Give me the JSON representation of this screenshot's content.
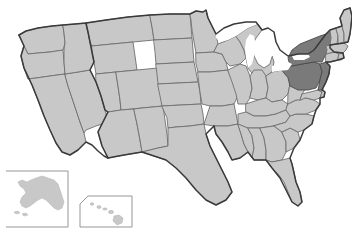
{
  "map": {
    "title": "United States choropleth map",
    "projection": "albers-usa",
    "background_color": "#ffffff",
    "base_state_fill": "#c8c8c8",
    "highlight_fill": "#7a7a7a",
    "border_color": "#6e6e6e",
    "national_outline_color": "#3a3a3a",
    "lake_fill": "#ffffff",
    "inset_box_color": "#8a8a8a",
    "highlighted_region_label": "Mid-Atlantic",
    "highlighted_states": [
      "New York",
      "Pennsylvania",
      "New Jersey"
    ],
    "insets": [
      {
        "name": "Alaska",
        "box_shape": "rectangle"
      },
      {
        "name": "Hawaii",
        "box_shape": "angled-corner"
      }
    ],
    "states": [
      {
        "code": "WA",
        "name": "Washington",
        "highlighted": false
      },
      {
        "code": "OR",
        "name": "Oregon",
        "highlighted": false
      },
      {
        "code": "CA",
        "name": "California",
        "highlighted": false
      },
      {
        "code": "NV",
        "name": "Nevada",
        "highlighted": false
      },
      {
        "code": "ID",
        "name": "Idaho",
        "highlighted": false
      },
      {
        "code": "MT",
        "name": "Montana",
        "highlighted": false
      },
      {
        "code": "WY",
        "name": "Wyoming",
        "highlighted": false
      },
      {
        "code": "UT",
        "name": "Utah",
        "highlighted": false
      },
      {
        "code": "AZ",
        "name": "Arizona",
        "highlighted": false
      },
      {
        "code": "CO",
        "name": "Colorado",
        "highlighted": false
      },
      {
        "code": "NM",
        "name": "New Mexico",
        "highlighted": false
      },
      {
        "code": "ND",
        "name": "North Dakota",
        "highlighted": false
      },
      {
        "code": "SD",
        "name": "South Dakota",
        "highlighted": false
      },
      {
        "code": "NE",
        "name": "Nebraska",
        "highlighted": false
      },
      {
        "code": "KS",
        "name": "Kansas",
        "highlighted": false
      },
      {
        "code": "OK",
        "name": "Oklahoma",
        "highlighted": false
      },
      {
        "code": "TX",
        "name": "Texas",
        "highlighted": false
      },
      {
        "code": "MN",
        "name": "Minnesota",
        "highlighted": false
      },
      {
        "code": "IA",
        "name": "Iowa",
        "highlighted": false
      },
      {
        "code": "MO",
        "name": "Missouri",
        "highlighted": false
      },
      {
        "code": "AR",
        "name": "Arkansas",
        "highlighted": false
      },
      {
        "code": "LA",
        "name": "Louisiana",
        "highlighted": false
      },
      {
        "code": "WI",
        "name": "Wisconsin",
        "highlighted": false
      },
      {
        "code": "IL",
        "name": "Illinois",
        "highlighted": false
      },
      {
        "code": "MI",
        "name": "Michigan",
        "highlighted": false
      },
      {
        "code": "IN",
        "name": "Indiana",
        "highlighted": false
      },
      {
        "code": "OH",
        "name": "Ohio",
        "highlighted": false
      },
      {
        "code": "KY",
        "name": "Kentucky",
        "highlighted": false
      },
      {
        "code": "TN",
        "name": "Tennessee",
        "highlighted": false
      },
      {
        "code": "MS",
        "name": "Mississippi",
        "highlighted": false
      },
      {
        "code": "AL",
        "name": "Alabama",
        "highlighted": false
      },
      {
        "code": "GA",
        "name": "Georgia",
        "highlighted": false
      },
      {
        "code": "FL",
        "name": "Florida",
        "highlighted": false
      },
      {
        "code": "SC",
        "name": "South Carolina",
        "highlighted": false
      },
      {
        "code": "NC",
        "name": "North Carolina",
        "highlighted": false
      },
      {
        "code": "VA",
        "name": "Virginia",
        "highlighted": false
      },
      {
        "code": "WV",
        "name": "West Virginia",
        "highlighted": false
      },
      {
        "code": "MD",
        "name": "Maryland",
        "highlighted": false
      },
      {
        "code": "DE",
        "name": "Delaware",
        "highlighted": false
      },
      {
        "code": "PA",
        "name": "Pennsylvania",
        "highlighted": true
      },
      {
        "code": "NJ",
        "name": "New Jersey",
        "highlighted": true
      },
      {
        "code": "NY",
        "name": "New York",
        "highlighted": true
      },
      {
        "code": "CT",
        "name": "Connecticut",
        "highlighted": false
      },
      {
        "code": "RI",
        "name": "Rhode Island",
        "highlighted": false
      },
      {
        "code": "MA",
        "name": "Massachusetts",
        "highlighted": false
      },
      {
        "code": "VT",
        "name": "Vermont",
        "highlighted": false
      },
      {
        "code": "NH",
        "name": "New Hampshire",
        "highlighted": false
      },
      {
        "code": "ME",
        "name": "Maine",
        "highlighted": false
      },
      {
        "code": "AK",
        "name": "Alaska",
        "highlighted": false
      },
      {
        "code": "HI",
        "name": "Hawaii",
        "highlighted": false
      }
    ]
  }
}
